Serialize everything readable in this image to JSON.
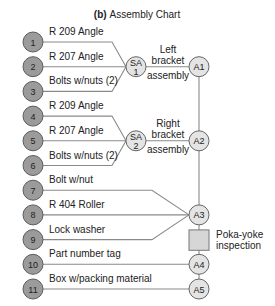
{
  "title": {
    "prefix": "(b)",
    "text": "Assembly Chart"
  },
  "components": [
    {
      "number": "1",
      "label": "R 209 Angle",
      "feeds": "SA1"
    },
    {
      "number": "2",
      "label": "R 207 Angle",
      "feeds": "SA1"
    },
    {
      "number": "3",
      "label": "Bolts w/nuts (2)",
      "feeds": "SA1"
    },
    {
      "number": "4",
      "label": "R 209 Angle",
      "feeds": "SA2"
    },
    {
      "number": "5",
      "label": "R 207 Angle",
      "feeds": "SA2"
    },
    {
      "number": "6",
      "label": "Bolts w/nuts (2)",
      "feeds": "SA2"
    },
    {
      "number": "7",
      "label": "Bolt w/nut",
      "feeds": "A3"
    },
    {
      "number": "8",
      "label": "R 404 Roller",
      "feeds": "A3"
    },
    {
      "number": "9",
      "label": "Lock washer",
      "feeds": "A3"
    },
    {
      "number": "10",
      "label": "Part number tag",
      "feeds": "A4"
    },
    {
      "number": "11",
      "label": "Box w/packing material",
      "feeds": "A5"
    }
  ],
  "subassemblies": [
    {
      "id": "SA1",
      "line1": "SA",
      "line2": "1",
      "caption": [
        "Left",
        "bracket",
        "assembly"
      ],
      "feeds": "A1"
    },
    {
      "id": "SA2",
      "line1": "SA",
      "line2": "2",
      "caption": [
        "Right",
        "bracket",
        "assembly"
      ],
      "feeds": "A2"
    }
  ],
  "assemblies": [
    {
      "id": "A1",
      "label": "A1"
    },
    {
      "id": "A2",
      "label": "A2"
    },
    {
      "id": "A3",
      "label": "A3"
    },
    {
      "id": "A4",
      "label": "A4"
    },
    {
      "id": "A5",
      "label": "A5"
    }
  ],
  "inspection": {
    "label_line1": "Poka-yoke",
    "label_line2": "inspection",
    "between": [
      "A3",
      "A4"
    ]
  }
}
